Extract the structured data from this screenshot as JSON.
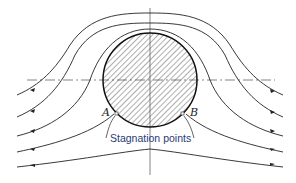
{
  "diagram": {
    "labels": {
      "point_a": "A",
      "point_b": "B",
      "caption": "Stagnation points"
    },
    "cylinder": {
      "cx": 150,
      "cy": 80,
      "r": 47,
      "fill": "hatched"
    },
    "streamlines": 5,
    "colors": {
      "line": "#222222",
      "caption": "#2a3a7a",
      "axis": "#555555"
    }
  }
}
